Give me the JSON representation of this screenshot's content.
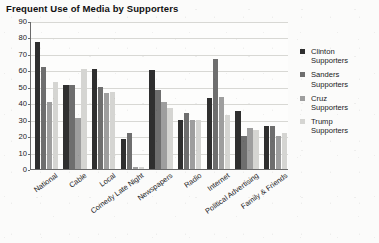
{
  "chart_data": {
    "type": "bar",
    "title": "Frequent Use of Media by Supporters",
    "xlabel": "",
    "ylabel": "",
    "ylim": [
      0,
      90
    ],
    "ytick_step": 10,
    "yticks": [
      "90",
      "80",
      "70",
      "60",
      "50",
      "40",
      "30",
      "20",
      "10",
      "0"
    ],
    "grid": true,
    "legend_position": "right",
    "categories": [
      "National",
      "Cable",
      "Local",
      "Comedy Late Night",
      "Newspapers",
      "Radio",
      "Internet",
      "Political Advertising",
      "Family & Friends"
    ],
    "series": [
      {
        "name": "Clinton Supporters",
        "color": "#2f2f2f",
        "values": [
          77,
          51,
          61,
          18,
          60,
          30,
          43,
          35,
          26
        ]
      },
      {
        "name": "Sanders Supporters",
        "color": "#6e6e6e",
        "values": [
          62,
          51,
          50,
          22,
          48,
          34,
          67,
          20,
          26
        ]
      },
      {
        "name": "Cruz Supporters",
        "color": "#9e9e9e",
        "values": [
          41,
          31,
          46,
          1,
          41,
          30,
          44,
          25,
          20
        ]
      },
      {
        "name": "Trump Supporters",
        "color": "#d5d5d2",
        "values": [
          53,
          61,
          47,
          1,
          37,
          30,
          33,
          24,
          22
        ]
      }
    ]
  },
  "legend": {
    "items": [
      {
        "name": "Clinton",
        "sub": "Supporters",
        "color": "#2f2f2f"
      },
      {
        "name": "Sanders",
        "sub": "Supporters",
        "color": "#6e6e6e"
      },
      {
        "name": "Cruz",
        "sub": "Supporters",
        "color": "#9e9e9e"
      },
      {
        "name": "Trump",
        "sub": "Supporters",
        "color": "#d5d5d2"
      }
    ]
  }
}
